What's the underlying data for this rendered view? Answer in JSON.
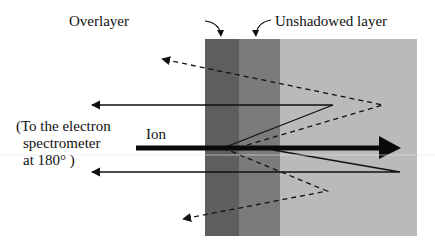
{
  "diagram": {
    "labels": {
      "overlayer": "Overlayer",
      "unshadowed": "Unshadowed layer",
      "ion": "Ion",
      "spectrometer_line1": "(To the electron",
      "spectrometer_line2": "spectrometer",
      "spectrometer_line3": "at 180° )"
    },
    "regions": [
      {
        "name": "overlayer",
        "x": 205,
        "width": 34,
        "color": "#5e5e5e"
      },
      {
        "name": "unshadowed-layer",
        "x": 239,
        "width": 41,
        "color": "#7a7a7a"
      },
      {
        "name": "bulk",
        "x": 280,
        "width": 137,
        "color": "#b9b9b9"
      }
    ],
    "block": {
      "top": 39,
      "bottom": 236
    },
    "ion_beam": {
      "x1": 136,
      "x2": 400,
      "y": 148
    },
    "electron_paths": [
      {
        "style": "solid",
        "points": [
          [
            223,
            148
          ],
          [
            333,
            105
          ],
          [
            86,
            105
          ]
        ]
      },
      {
        "style": "solid",
        "points": [
          [
            273,
            150
          ],
          [
            400,
            172
          ],
          [
            86,
            172
          ]
        ]
      },
      {
        "style": "dashed",
        "points": [
          [
            247,
            145
          ],
          [
            383,
            105
          ],
          [
            156,
            57
          ]
        ]
      },
      {
        "style": "dashed",
        "points": [
          [
            223,
            148
          ],
          [
            327,
            191
          ],
          [
            177,
            221
          ]
        ]
      }
    ]
  }
}
